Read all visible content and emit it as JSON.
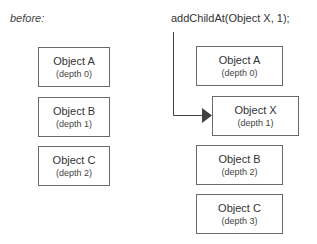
{
  "before": {
    "label": "before:",
    "objects": [
      {
        "name": "Object A",
        "depth": "(depth 0)"
      },
      {
        "name": "Object B",
        "depth": "(depth 1)"
      },
      {
        "name": "Object C",
        "depth": "(depth 2)"
      }
    ]
  },
  "after": {
    "code": "addChildAt(Object X, 1);",
    "objects": [
      {
        "name": "Object A",
        "depth": "(depth 0)"
      },
      {
        "name": "Object X",
        "depth": "(depth 1)"
      },
      {
        "name": "Object B",
        "depth": "(depth 2)"
      },
      {
        "name": "Object C",
        "depth": "(depth 3)"
      }
    ]
  },
  "colors": {
    "border": "#6a6a6a",
    "arrow": "#404040",
    "text": "#333333"
  }
}
